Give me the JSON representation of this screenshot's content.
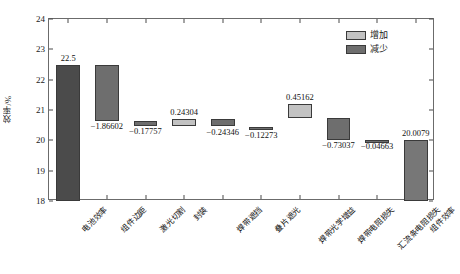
{
  "chart_data": {
    "type": "bar",
    "subtype": "waterfall",
    "title": "",
    "xlabel": "",
    "ylabel": "效率/%",
    "ylim": [
      18,
      24
    ],
    "yticks": [
      18,
      19,
      20,
      21,
      22,
      23,
      24
    ],
    "ytick_labels": [
      "18",
      "19",
      "20",
      "21",
      "22",
      "23",
      "24"
    ],
    "grid": false,
    "legend_position": "top-right",
    "categories": [
      "电池效率",
      "组件边距",
      "激光切割",
      "封装",
      "焊带遮挡",
      "叠片遮光",
      "焊带光学增益",
      "焊带电阻损失",
      "汇流条电阻损失",
      "组件效率"
    ],
    "values": [
      22.5,
      -1.86602,
      -0.17757,
      0.24304,
      -0.24346,
      -0.12273,
      0.45162,
      -0.73037,
      -0.04663,
      20.0079
    ],
    "value_labels": [
      "22.5",
      "−1.86602",
      "−0.17757",
      "0.24304",
      "−0.24346",
      "−0.12273",
      "0.45162",
      "−0.73037",
      "−0.04663",
      "20.0079"
    ],
    "kinds": [
      "total",
      "decrease",
      "decrease",
      "increase",
      "decrease",
      "decrease",
      "increase",
      "decrease",
      "decrease",
      "total"
    ],
    "cumulative_start": [
      18.0,
      20.63398,
      20.45641,
      20.45641,
      20.45599,
      20.33326,
      20.74827,
      20.0179,
      19.97127,
      18.0
    ],
    "cumulative_end": [
      22.5,
      22.5,
      20.63398,
      20.69945,
      20.69945,
      20.45599,
      21.19989,
      20.74827,
      20.0179,
      20.0079
    ],
    "legend": [
      {
        "label": "增加",
        "color": "#c2c2c2"
      },
      {
        "label": "减少",
        "color": "#6e6e6e"
      }
    ],
    "colors": {
      "increase": "#c2c2c2",
      "decrease": "#6e6e6e",
      "base_total": "#4b4b4b",
      "final_total": "#777777",
      "axis": "#6b6b6b",
      "text": "#111111"
    }
  }
}
